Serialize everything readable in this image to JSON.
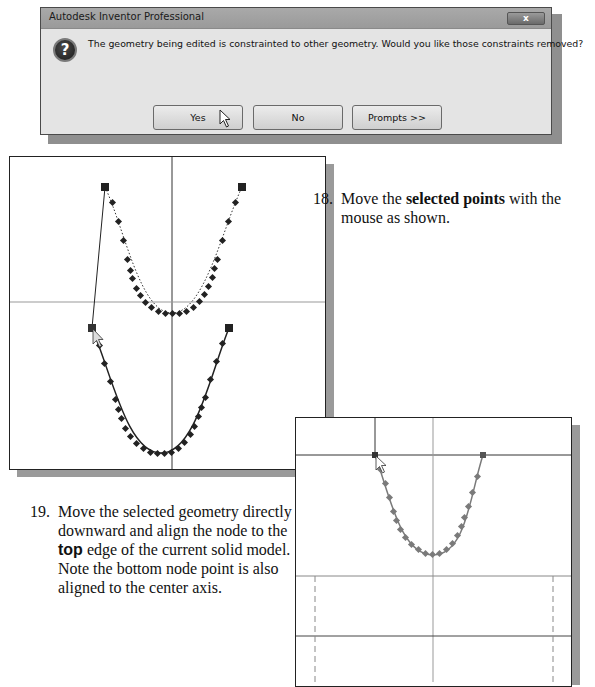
{
  "dialog": {
    "title": "Autodesk Inventor Professional",
    "close_label": "x",
    "icon": "question-icon",
    "icon_glyph": "?",
    "message": "The geometry being edited is constrainted to other geometry. Would you like those constraints removed?",
    "buttons": [
      {
        "label": "Yes"
      },
      {
        "label": "No"
      },
      {
        "label": "Prompts >>"
      }
    ]
  },
  "step18": {
    "number": "18.",
    "text_before": "Move the ",
    "bold": "selected points",
    "text_after": " with the",
    "line2": "mouse as shown."
  },
  "step19": {
    "number": "19.",
    "line1": "Move the selected geometry directly",
    "line2": "downward and align the node to the",
    "bold": "top",
    "line3_after": " edge of the current solid model.",
    "line4": "Note the bottom node point is also",
    "line5": "aligned to the center axis."
  },
  "colors": {
    "dialog_bg": "#e4e4e4",
    "titlebar": "#a0a0a0",
    "curve_dark": "#222222",
    "curve_gray": "#7a7a7a",
    "shadow": "#9a9a9a"
  }
}
